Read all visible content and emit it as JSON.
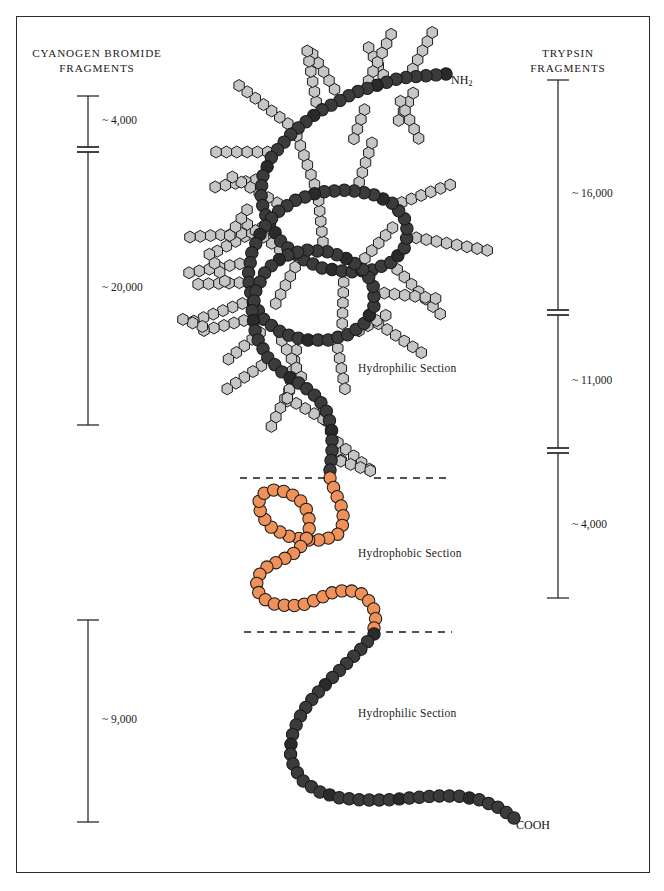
{
  "figure": {
    "header_faint_text": " ",
    "background": "#ffffff",
    "frame_color": "#2b2b2b"
  },
  "left_scale": {
    "title_line1": "CYANOGEN BROMIDE",
    "title_line2": "FRAGMENTS",
    "segments": [
      {
        "label": "~ 4,000",
        "top": 96,
        "bottom": 147
      },
      {
        "label": "~ 20,000",
        "top": 152,
        "bottom": 425
      },
      {
        "label": "~ 9,000",
        "top": 620,
        "bottom": 822
      }
    ],
    "axis_x": 88
  },
  "right_scale": {
    "title_line1": "TRYPSIN",
    "title_line2": "FRAGMENTS",
    "segments": [
      {
        "label": "~ 16,000",
        "top": 80,
        "bottom": 310
      },
      {
        "label": "~ 11,000",
        "top": 315,
        "bottom": 448
      },
      {
        "label": "~ 4,000",
        "top": 453,
        "bottom": 598
      }
    ],
    "axis_x": 558
  },
  "section_labels": [
    {
      "text": "Hydrophilic Section",
      "x": 358,
      "y": 362
    },
    {
      "text": "Hydrophobic Section",
      "x": 358,
      "y": 547
    },
    {
      "text": "Hydrophilic Section",
      "x": 358,
      "y": 707
    }
  ],
  "termini": [
    {
      "text": "NH",
      "sub": "2",
      "x": 451,
      "y": 73
    },
    {
      "text": "COOH",
      "sub": "",
      "x": 516,
      "y": 818
    }
  ],
  "boundaries": {
    "dashes": [
      {
        "y": 478,
        "left_x1": 240,
        "left_x2": 330,
        "right_x1": 374,
        "right_x2": 446
      },
      {
        "y": 632,
        "left_x1": 244,
        "left_x2": 356,
        "right_x1": 386,
        "right_x2": 452
      }
    ],
    "dash_color": "#1a1a1a"
  },
  "chain_data": {
    "type": "diagram",
    "title": "Glycoprotein polypeptide chain with carbohydrate side chains",
    "bead_colors": {
      "backbone_dark": "#3b3b3b",
      "backbone_darker": "#2a2a2a",
      "hydrophobic_orange": "#ef9158",
      "branch_gray": "#c6c6c6",
      "outline": "#1a1a1a"
    },
    "bead_radius_backbone": 6.2,
    "bead_radius_branch": 6.0,
    "backbone_path_top": [
      [
        446,
        74
      ],
      [
        400,
        78
      ],
      [
        356,
        92
      ],
      [
        318,
        112
      ],
      [
        292,
        133
      ],
      [
        272,
        156
      ],
      [
        262,
        178
      ],
      [
        261,
        200
      ],
      [
        268,
        222
      ],
      [
        282,
        243
      ],
      [
        300,
        258
      ],
      [
        322,
        268
      ],
      [
        348,
        272
      ],
      [
        372,
        270
      ],
      [
        392,
        262
      ],
      [
        404,
        249
      ],
      [
        408,
        233
      ],
      [
        404,
        217
      ],
      [
        392,
        203
      ],
      [
        372,
        194
      ],
      [
        348,
        190
      ],
      [
        320,
        192
      ],
      [
        296,
        200
      ],
      [
        276,
        213
      ],
      [
        262,
        230
      ],
      [
        252,
        252
      ],
      [
        248,
        276
      ],
      [
        252,
        300
      ],
      [
        264,
        320
      ],
      [
        282,
        333
      ],
      [
        304,
        340
      ],
      [
        328,
        340
      ],
      [
        350,
        334
      ],
      [
        366,
        322
      ],
      [
        374,
        306
      ],
      [
        374,
        288
      ],
      [
        366,
        272
      ],
      [
        350,
        260
      ],
      [
        330,
        252
      ],
      [
        306,
        250
      ],
      [
        284,
        256
      ],
      [
        266,
        270
      ],
      [
        256,
        290
      ],
      [
        252,
        312
      ],
      [
        256,
        336
      ],
      [
        268,
        358
      ],
      [
        284,
        374
      ],
      [
        302,
        385
      ],
      [
        318,
        398
      ],
      [
        328,
        414
      ],
      [
        332,
        432
      ],
      [
        332,
        452
      ],
      [
        330,
        470
      ]
    ],
    "hydrophobic_path": [
      [
        330,
        478
      ],
      [
        336,
        494
      ],
      [
        342,
        508
      ],
      [
        344,
        522
      ],
      [
        338,
        534
      ],
      [
        324,
        540
      ],
      [
        306,
        540
      ],
      [
        288,
        536
      ],
      [
        272,
        528
      ],
      [
        262,
        516
      ],
      [
        258,
        504
      ],
      [
        262,
        494
      ],
      [
        274,
        490
      ],
      [
        288,
        492
      ],
      [
        300,
        500
      ],
      [
        308,
        512
      ],
      [
        310,
        526
      ],
      [
        306,
        540
      ],
      [
        296,
        552
      ],
      [
        282,
        560
      ],
      [
        268,
        566
      ],
      [
        258,
        576
      ],
      [
        256,
        588
      ],
      [
        262,
        598
      ],
      [
        274,
        604
      ],
      [
        290,
        606
      ],
      [
        306,
        604
      ],
      [
        320,
        598
      ],
      [
        334,
        592
      ],
      [
        348,
        590
      ],
      [
        362,
        594
      ],
      [
        372,
        604
      ],
      [
        376,
        616
      ],
      [
        374,
        628
      ]
    ],
    "backbone_path_bottom": [
      [
        374,
        634
      ],
      [
        362,
        648
      ],
      [
        348,
        662
      ],
      [
        334,
        676
      ],
      [
        320,
        690
      ],
      [
        308,
        704
      ],
      [
        298,
        720
      ],
      [
        292,
        736
      ],
      [
        290,
        752
      ],
      [
        294,
        768
      ],
      [
        304,
        782
      ],
      [
        320,
        792
      ],
      [
        340,
        798
      ],
      [
        362,
        800
      ],
      [
        386,
        800
      ],
      [
        410,
        798
      ],
      [
        434,
        796
      ],
      [
        458,
        796
      ],
      [
        480,
        800
      ],
      [
        500,
        808
      ],
      [
        514,
        818
      ]
    ],
    "branches": [
      {
        "start": [
          408,
          78
        ],
        "angle": -62,
        "n": 5
      },
      {
        "start": [
          388,
          84
        ],
        "angle": -118,
        "n": 4
      },
      {
        "start": [
          364,
          90
        ],
        "angle": -64,
        "n": 6
      },
      {
        "start": [
          340,
          98
        ],
        "angle": -122,
        "n": 5
      },
      {
        "start": [
          418,
          84
        ],
        "angle": 118,
        "n": 4
      },
      {
        "start": [
          396,
          92
        ],
        "angle": 64,
        "n": 5
      },
      {
        "start": [
          368,
          100
        ],
        "angle": 110,
        "n": 4
      },
      {
        "start": [
          318,
          112
        ],
        "angle": -100,
        "n": 6
      },
      {
        "start": [
          296,
          130
        ],
        "angle": -142,
        "n": 7
      },
      {
        "start": [
          278,
          152
        ],
        "angle": 180,
        "n": 6
      },
      {
        "start": [
          266,
          178
        ],
        "angle": 170,
        "n": 5
      },
      {
        "start": [
          272,
          222
        ],
        "angle": 152,
        "n": 6
      },
      {
        "start": [
          300,
          258
        ],
        "angle": 118,
        "n": 5
      },
      {
        "start": [
          344,
          272
        ],
        "angle": 92,
        "n": 5
      },
      {
        "start": [
          390,
          262
        ],
        "angle": 46,
        "n": 7
      },
      {
        "start": [
          406,
          236
        ],
        "angle": 10,
        "n": 8
      },
      {
        "start": [
          392,
          206
        ],
        "angle": -20,
        "n": 6
      },
      {
        "start": [
          356,
          192
        ],
        "angle": -72,
        "n": 5
      },
      {
        "start": [
          318,
          194
        ],
        "angle": -110,
        "n": 6
      },
      {
        "start": [
          286,
          208
        ],
        "angle": -150,
        "n": 6
      },
      {
        "start": [
          262,
          232
        ],
        "angle": 176,
        "n": 7
      },
      {
        "start": [
          250,
          262
        ],
        "angle": 170,
        "n": 6
      },
      {
        "start": [
          252,
          300
        ],
        "angle": 160,
        "n": 6
      },
      {
        "start": [
          268,
          326
        ],
        "angle": 140,
        "n": 5
      },
      {
        "start": [
          298,
          340
        ],
        "angle": 100,
        "n": 6
      },
      {
        "start": [
          336,
          338
        ],
        "angle": 80,
        "n": 5
      },
      {
        "start": [
          370,
          318
        ],
        "angle": 34,
        "n": 6
      },
      {
        "start": [
          374,
          292
        ],
        "angle": 6,
        "n": 6
      },
      {
        "start": [
          358,
          266
        ],
        "angle": -48,
        "n": 5
      },
      {
        "start": [
          324,
          252
        ],
        "angle": -96,
        "n": 5
      },
      {
        "start": [
          288,
          256
        ],
        "angle": -142,
        "n": 5
      },
      {
        "start": [
          260,
          282
        ],
        "angle": 178,
        "n": 6
      },
      {
        "start": [
          254,
          318
        ],
        "angle": 166,
        "n": 5
      },
      {
        "start": [
          270,
          360
        ],
        "angle": 146,
        "n": 5
      },
      {
        "start": [
          294,
          380
        ],
        "angle": 116,
        "n": 5
      },
      {
        "start": [
          320,
          402
        ],
        "angle": 70,
        "n": 6
      },
      {
        "start": [
          330,
          436
        ],
        "angle": 40,
        "n": 5
      },
      {
        "start": [
          331,
          458
        ],
        "angle": 18,
        "n": 4
      },
      {
        "start": [
          306,
          386
        ],
        "angle": -118,
        "n": 5
      },
      {
        "start": [
          332,
          424
        ],
        "angle": -150,
        "n": 5
      },
      {
        "start": [
          350,
          336
        ],
        "angle": -30,
        "n": 4
      },
      {
        "start": [
          224,
          244
        ],
        "angle": -56,
        "n": 4
      },
      {
        "start": [
          230,
          290
        ],
        "angle": -120,
        "n": 4
      },
      {
        "start": [
          212,
          330
        ],
        "angle": -160,
        "n": 3
      }
    ]
  }
}
